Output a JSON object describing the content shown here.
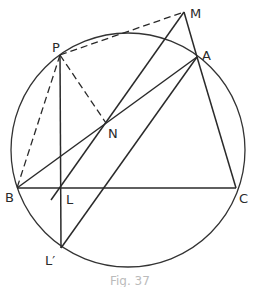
{
  "diagram": {
    "type": "geometry",
    "circle": {
      "cx": 128,
      "cy": 150,
      "r": 117
    },
    "points": {
      "P": {
        "label": "P",
        "x": 60,
        "y": 55
      },
      "M": {
        "label": "M",
        "x": 184,
        "y": 12
      },
      "A": {
        "label": "A",
        "x": 197,
        "y": 57
      },
      "N": {
        "label": "N",
        "x": 106,
        "y": 123
      },
      "B": {
        "label": "B",
        "x": 17,
        "y": 188
      },
      "L": {
        "label": "L",
        "x": 60,
        "y": 188
      },
      "C": {
        "label": "C",
        "x": 236,
        "y": 188
      },
      "L_prime": {
        "label": "L′",
        "x": 61,
        "y": 248
      }
    },
    "segments": [
      {
        "from": "P",
        "to": "M",
        "style": "dashed"
      },
      {
        "from": "P",
        "to": "B",
        "style": "dashed"
      },
      {
        "from": "P",
        "to": "N",
        "style": "dashed"
      },
      {
        "from": "P",
        "to": "L_prime",
        "style": "solid"
      },
      {
        "from": "M",
        "to": "A",
        "style": "solid"
      },
      {
        "from": "M",
        "to": "L",
        "style": "solid",
        "extended_to": {
          "x": 51,
          "y": 200
        }
      },
      {
        "from": "B",
        "to": "A",
        "style": "solid"
      },
      {
        "from": "B",
        "to": "C",
        "style": "solid"
      },
      {
        "from": "A",
        "to": "C",
        "style": "solid"
      },
      {
        "from": "L_prime",
        "to": "A",
        "style": "solid"
      }
    ],
    "caption": "Fig. 37"
  }
}
